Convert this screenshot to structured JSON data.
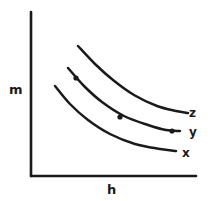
{
  "figure": {
    "background_color": "#ffffff",
    "ink_color": "#1a1a1a",
    "width": 208,
    "height": 201
  },
  "axes": {
    "y_axis_label": "m",
    "x_axis_label": "h",
    "origin": {
      "x": 31,
      "y": 176
    },
    "y_axis_top": {
      "x": 31,
      "y": 12
    },
    "x_axis_right": {
      "x": 196,
      "y": 176
    },
    "line_width": 2.6,
    "ticks": [],
    "gridlines": false
  },
  "curves": [
    {
      "id": "x",
      "label": "x",
      "label_position": {
        "x": 182,
        "y": 147
      },
      "points": [
        {
          "x": 55,
          "y": 86
        },
        {
          "x": 70,
          "y": 104
        },
        {
          "x": 88,
          "y": 120
        },
        {
          "x": 110,
          "y": 134
        },
        {
          "x": 135,
          "y": 144
        },
        {
          "x": 160,
          "y": 149
        },
        {
          "x": 176,
          "y": 151
        }
      ],
      "markers": []
    },
    {
      "id": "y",
      "label": "y",
      "label_position": {
        "x": 189,
        "y": 126
      },
      "points": [
        {
          "x": 68,
          "y": 68
        },
        {
          "x": 84,
          "y": 86
        },
        {
          "x": 102,
          "y": 102
        },
        {
          "x": 124,
          "y": 116
        },
        {
          "x": 148,
          "y": 125
        },
        {
          "x": 166,
          "y": 130
        },
        {
          "x": 180,
          "y": 131
        }
      ],
      "markers": [
        {
          "x": 76,
          "y": 78
        },
        {
          "x": 120,
          "y": 117
        },
        {
          "x": 172,
          "y": 131
        }
      ]
    },
    {
      "id": "z",
      "label": "z",
      "label_position": {
        "x": 189,
        "y": 107
      },
      "points": [
        {
          "x": 78,
          "y": 46
        },
        {
          "x": 95,
          "y": 64
        },
        {
          "x": 113,
          "y": 80
        },
        {
          "x": 134,
          "y": 95
        },
        {
          "x": 157,
          "y": 106
        },
        {
          "x": 176,
          "y": 111
        },
        {
          "x": 188,
          "y": 113
        }
      ],
      "markers": []
    }
  ],
  "chart_data": {
    "type": "line",
    "title": "",
    "subtitle": "",
    "xlabel": "h",
    "ylabel": "m",
    "xlim": [
      0,
      1
    ],
    "ylim": [
      0,
      1
    ],
    "grid": false,
    "legend": "inline-right-end-labels",
    "x_tick_labels": [],
    "y_tick_labels": [],
    "annotations": [
      {
        "text": "z",
        "target_series": "z",
        "position": "right-end"
      },
      {
        "text": "y",
        "target_series": "y",
        "position": "right-end"
      },
      {
        "text": "x",
        "target_series": "x",
        "position": "right-end"
      }
    ],
    "series": [
      {
        "name": "x",
        "description": "lowest convex decreasing curve",
        "x": [
          0.145,
          0.236,
          0.345,
          0.479,
          0.63,
          0.782,
          0.879
        ],
        "y": [
          0.549,
          0.439,
          0.341,
          0.256,
          0.195,
          0.165,
          0.152
        ]
      },
      {
        "name": "y",
        "description": "middle convex decreasing curve with three markers",
        "x": [
          0.224,
          0.321,
          0.43,
          0.564,
          0.709,
          0.818,
          0.903
        ],
        "y": [
          0.659,
          0.549,
          0.451,
          0.366,
          0.311,
          0.28,
          0.274
        ],
        "markers_x": [
          0.273,
          0.539,
          0.855
        ],
        "markers_y": [
          0.598,
          0.36,
          0.274
        ]
      },
      {
        "name": "z",
        "description": "highest convex decreasing curve",
        "x": [
          0.285,
          0.388,
          0.497,
          0.624,
          0.764,
          0.879,
          0.952
        ],
        "y": [
          0.793,
          0.683,
          0.585,
          0.494,
          0.427,
          0.396,
          0.384
        ]
      }
    ]
  }
}
